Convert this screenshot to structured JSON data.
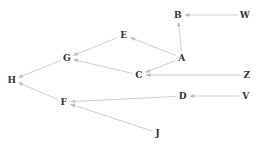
{
  "diagram": {
    "type": "directed-graph",
    "edge_color": "#cfcfcf",
    "label_color": "#333333",
    "nodes": [
      {
        "id": "B",
        "label": "B",
        "x": 178,
        "y": 15
      },
      {
        "id": "W",
        "label": "W",
        "x": 245,
        "y": 15
      },
      {
        "id": "E",
        "label": "E",
        "x": 124,
        "y": 35
      },
      {
        "id": "A",
        "label": "A",
        "x": 182,
        "y": 58
      },
      {
        "id": "G",
        "label": "G",
        "x": 67,
        "y": 58
      },
      {
        "id": "C",
        "label": "C",
        "x": 139,
        "y": 75
      },
      {
        "id": "Z",
        "label": "Z",
        "x": 247,
        "y": 75
      },
      {
        "id": "H",
        "label": "H",
        "x": 12,
        "y": 80
      },
      {
        "id": "F",
        "label": "F",
        "x": 64,
        "y": 102
      },
      {
        "id": "D",
        "label": "D",
        "x": 183,
        "y": 96
      },
      {
        "id": "V",
        "label": "V",
        "x": 246,
        "y": 96
      },
      {
        "id": "J",
        "label": "J",
        "x": 158,
        "y": 133
      }
    ],
    "edges": [
      {
        "from": "W",
        "to": "B"
      },
      {
        "from": "A",
        "to": "B"
      },
      {
        "from": "A",
        "to": "E"
      },
      {
        "from": "A",
        "to": "C"
      },
      {
        "from": "E",
        "to": "G"
      },
      {
        "from": "C",
        "to": "G"
      },
      {
        "from": "Z",
        "to": "C"
      },
      {
        "from": "G",
        "to": "H"
      },
      {
        "from": "F",
        "to": "H"
      },
      {
        "from": "D",
        "to": "F"
      },
      {
        "from": "J",
        "to": "F"
      },
      {
        "from": "V",
        "to": "D"
      }
    ]
  }
}
